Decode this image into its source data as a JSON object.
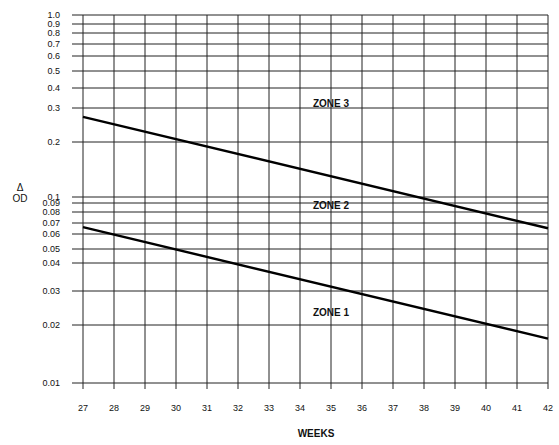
{
  "chart_data": {
    "type": "line",
    "title": "",
    "xlabel": "WEEKS",
    "ylabel": "Δ OD",
    "ylabel_lines": [
      "Δ",
      "OD"
    ],
    "x_scale": "linear",
    "y_scale": "log",
    "xlim": [
      27,
      42
    ],
    "ylim": [
      0.01,
      1.0
    ],
    "grid": true,
    "legend": null,
    "x_ticks": [
      27,
      28,
      29,
      30,
      31,
      32,
      33,
      34,
      35,
      36,
      37,
      38,
      39,
      40,
      41,
      42
    ],
    "x_tick_labels": [
      "27",
      "28",
      "29",
      "30",
      "31",
      "32",
      "33",
      "34",
      "35",
      "36",
      "37",
      "38",
      "39",
      "40",
      "41",
      "42"
    ],
    "y_ticks": [
      1.0,
      0.9,
      0.8,
      0.7,
      0.6,
      0.5,
      0.4,
      0.3,
      0.2,
      0.1,
      0.09,
      0.08,
      0.07,
      0.06,
      0.05,
      0.04,
      0.03,
      0.02,
      0.01
    ],
    "y_tick_labels": [
      "1.0",
      "0.9",
      "0.8",
      "0.7",
      "0.6",
      "0.5",
      "0.4",
      "0.3",
      "0.2",
      "0.1",
      "0.09",
      "0.08",
      "0.07",
      "0.06",
      "0.05",
      "0.04",
      "0.03",
      "0.02",
      "0.01"
    ],
    "series": [
      {
        "name": "Upper boundary (Zone 2/3)",
        "x": [
          27,
          42
        ],
        "values": [
          0.27,
          0.065
        ]
      },
      {
        "name": "Lower boundary (Zone 1/2)",
        "x": [
          27,
          42
        ],
        "values": [
          0.066,
          0.017
        ]
      }
    ],
    "annotations": [
      {
        "text": "ZONE 3",
        "x": 35,
        "y": 0.32
      },
      {
        "text": "ZONE 2",
        "x": 35,
        "y": 0.087
      },
      {
        "text": "ZONE 1",
        "x": 35,
        "y": 0.023
      }
    ]
  }
}
